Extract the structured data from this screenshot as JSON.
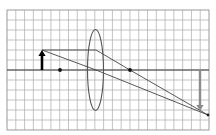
{
  "diagram": {
    "type": "thin converging lens ray diagram",
    "caption": "Converging lens ray diagram: object beyond 2F forms a real, inverted, enlarged image",
    "grid": {
      "x0": 7,
      "y0": 10,
      "x1": 209,
      "y1": 130,
      "columns": 23,
      "rows": 12,
      "color": "#b4b4b4"
    },
    "principal_axis": {
      "y": 70,
      "color": "#3a3a3a"
    },
    "lens": {
      "cx": 95.5,
      "cy": 70,
      "rx": 8,
      "ry": 40.5,
      "color": "#555555"
    },
    "object_arrow": {
      "x": 42,
      "base_y": 70,
      "tip_y": 50,
      "color": "#000000",
      "direction": "up"
    },
    "image_arrow": {
      "x": 200,
      "base_y": 70,
      "tip_y": 111,
      "color": "#8c8c8c",
      "direction": "down"
    },
    "focal_points": [
      {
        "label": "F",
        "x": 60,
        "y": 70
      },
      {
        "label": "F'",
        "x": 130,
        "y": 70
      }
    ],
    "rays": [
      {
        "name": "parallel-ray",
        "points": [
          [
            42,
            50
          ],
          [
            96,
            50
          ],
          [
            130,
            70
          ],
          [
            208,
            115
          ]
        ]
      },
      {
        "name": "central-ray",
        "points": [
          [
            42,
            50
          ],
          [
            96,
            70
          ],
          [
            208,
            115
          ]
        ]
      }
    ],
    "convergence_point": {
      "x": 208,
      "y": 115
    }
  }
}
